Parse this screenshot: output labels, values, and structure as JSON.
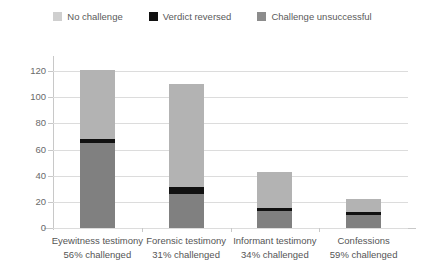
{
  "chart_data": {
    "type": "bar",
    "subtype": "stacked-vertical",
    "title": "",
    "xlabel": "",
    "ylabel": "",
    "ylim": [
      0,
      130
    ],
    "yticks": [
      0,
      20,
      40,
      60,
      80,
      100,
      120
    ],
    "grid": true,
    "legend_position": "top-center",
    "categories": [
      "Eyewitness testimony",
      "Forensic testimony",
      "Informant testimony",
      "Confessions"
    ],
    "category_sublabels": [
      "56% challenged",
      "31% challenged",
      "34% challenged",
      "59% challenged"
    ],
    "series": [
      {
        "name": "Challenge unsuccessful",
        "color": "#808080",
        "values": [
          65,
          26,
          13,
          10
        ]
      },
      {
        "name": "Verdict reversed",
        "color": "#111111",
        "values": [
          3,
          5,
          2,
          2
        ]
      },
      {
        "name": "No challenge",
        "color": "#b3b3b3",
        "values": [
          53,
          79,
          28,
          10
        ]
      }
    ],
    "totals": [
      121,
      110,
      43,
      22
    ],
    "stack_order_bottom_to_top": [
      "Challenge unsuccessful",
      "Verdict reversed",
      "No challenge"
    ]
  },
  "legend": {
    "items": [
      {
        "label": "No challenge",
        "color": "#cfcfcf"
      },
      {
        "label": "Verdict reversed",
        "color": "#111111"
      },
      {
        "label": "Challenge unsuccessful",
        "color": "#8c8c8c"
      }
    ]
  },
  "axis": {
    "y_tick_labels": [
      "0",
      "20",
      "40",
      "60",
      "80",
      "100",
      "120"
    ]
  },
  "colors": {
    "background": "#ffffff",
    "gridline": "#dcdcdc",
    "axis": "#c8c8c8",
    "text": "#555555",
    "no_challenge": "#b3b3b3",
    "verdict_reversed": "#111111",
    "challenge_unsuccessful": "#808080"
  }
}
